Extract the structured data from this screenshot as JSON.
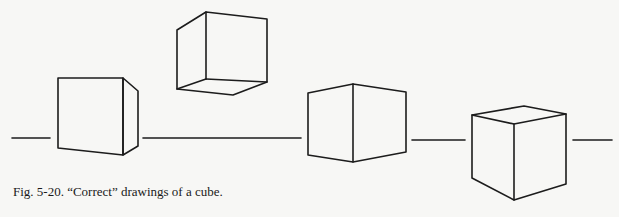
{
  "figure": {
    "caption": "Fig. 5-20. “Correct” drawings of a cube.",
    "stroke_color": "#1c1c1c",
    "background_color": "#f7f7f5",
    "horizon_segments": [
      {
        "x1": 12,
        "y1": 138,
        "x2": 50,
        "y2": 138
      },
      {
        "x1": 143,
        "y1": 138,
        "x2": 301,
        "y2": 138
      },
      {
        "x1": 412,
        "y1": 140,
        "x2": 465,
        "y2": 140
      },
      {
        "x1": 573,
        "y1": 140,
        "x2": 612,
        "y2": 140
      }
    ],
    "cubes": [
      {
        "name": "cube-1-left-below-eye",
        "description": "Cube seen mostly frontally, right side visible"
      },
      {
        "name": "cube-2-above-horizon",
        "description": "Cube seen from below, bottom face visible"
      },
      {
        "name": "cube-3-on-horizon",
        "description": "Cube edge-on at horizon, two side faces visible"
      },
      {
        "name": "cube-4-below-horizon",
        "description": "Cube seen from above, top face visible"
      }
    ]
  }
}
